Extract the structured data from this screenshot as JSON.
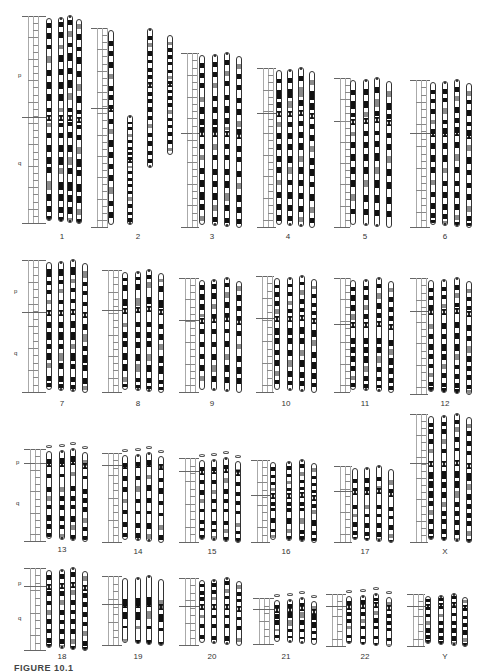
{
  "figure": {
    "caption": "FIGURE 10.1",
    "arm_labels": {
      "p": "p",
      "q": "q"
    },
    "colors": {
      "dark": "#111111",
      "grey": "#8a8a8a",
      "outline": "#333333",
      "background": "#ffffff"
    }
  },
  "chromosomes": [
    {
      "id": "1",
      "label": "1",
      "x": 28,
      "top": 18,
      "height": 203,
      "cen": 0.49,
      "cols": [
        46,
        58,
        67,
        76
      ],
      "labelX": 62,
      "labelY": 232,
      "armP": [
        18,
        72
      ],
      "armQ": [
        18,
        160
      ],
      "bands": [
        [
          0.02,
          0.025
        ],
        [
          0.07,
          0.03
        ],
        [
          0.13,
          0.02
        ],
        [
          0.18,
          0.035
        ],
        [
          0.25,
          0.03
        ],
        [
          0.31,
          0.035
        ],
        [
          0.37,
          0.035
        ],
        [
          0.44,
          0.02
        ],
        [
          0.51,
          0.02
        ],
        [
          0.56,
          0.025
        ],
        [
          0.62,
          0.035
        ],
        [
          0.68,
          0.035
        ],
        [
          0.73,
          0.03
        ],
        [
          0.8,
          0.04
        ],
        [
          0.86,
          0.035
        ],
        [
          0.92,
          0.03
        ],
        [
          0.97,
          0.02
        ]
      ]
    },
    {
      "id": "2",
      "label": "2",
      "x": 97,
      "top": 30,
      "height": 195,
      "cen": 0.4,
      "cols": [
        108,
        127,
        147,
        167
      ],
      "labelX": 138,
      "labelY": 232,
      "split": true,
      "bands": [
        [
          0.05,
          0.025
        ],
        [
          0.1,
          0.03
        ],
        [
          0.16,
          0.03
        ],
        [
          0.22,
          0.025
        ],
        [
          0.28,
          0.03
        ],
        [
          0.33,
          0.025
        ],
        [
          0.38,
          0.02
        ],
        [
          0.45,
          0.025
        ],
        [
          0.5,
          0.03
        ],
        [
          0.56,
          0.035
        ],
        [
          0.62,
          0.03
        ],
        [
          0.68,
          0.03
        ],
        [
          0.74,
          0.03
        ],
        [
          0.8,
          0.035
        ],
        [
          0.87,
          0.03
        ],
        [
          0.93,
          0.03
        ]
      ]
    },
    {
      "id": "3",
      "label": "3",
      "x": 187,
      "top": 55,
      "height": 170,
      "cen": 0.46,
      "cols": [
        199,
        212,
        224,
        236
      ],
      "labelX": 212,
      "labelY": 232,
      "bands": [
        [
          0.04,
          0.03
        ],
        [
          0.1,
          0.03
        ],
        [
          0.16,
          0.03
        ],
        [
          0.24,
          0.03
        ],
        [
          0.3,
          0.04
        ],
        [
          0.37,
          0.035
        ],
        [
          0.42,
          0.02
        ],
        [
          0.52,
          0.03
        ],
        [
          0.58,
          0.03
        ],
        [
          0.66,
          0.035
        ],
        [
          0.73,
          0.04
        ],
        [
          0.8,
          0.045
        ],
        [
          0.87,
          0.035
        ],
        [
          0.94,
          0.03
        ]
      ]
    },
    {
      "id": "4",
      "label": "4",
      "x": 263,
      "top": 70,
      "height": 155,
      "cen": 0.28,
      "cols": [
        276,
        287,
        298,
        309
      ],
      "labelX": 288,
      "labelY": 232,
      "bands": [
        [
          0.05,
          0.03
        ],
        [
          0.12,
          0.06
        ],
        [
          0.2,
          0.04
        ],
        [
          0.33,
          0.03
        ],
        [
          0.4,
          0.04
        ],
        [
          0.47,
          0.04
        ],
        [
          0.55,
          0.04
        ],
        [
          0.62,
          0.04
        ],
        [
          0.7,
          0.035
        ],
        [
          0.78,
          0.04
        ],
        [
          0.86,
          0.04
        ],
        [
          0.93,
          0.035
        ]
      ]
    },
    {
      "id": "5",
      "label": "5",
      "x": 340,
      "top": 80,
      "height": 145,
      "cen": 0.28,
      "cols": [
        350,
        363,
        374,
        386
      ],
      "labelX": 365,
      "labelY": 232,
      "bands": [
        [
          0.06,
          0.04
        ],
        [
          0.14,
          0.05
        ],
        [
          0.22,
          0.03
        ],
        [
          0.35,
          0.03
        ],
        [
          0.42,
          0.04
        ],
        [
          0.5,
          0.05
        ],
        [
          0.59,
          0.05
        ],
        [
          0.68,
          0.05
        ],
        [
          0.78,
          0.05
        ],
        [
          0.88,
          0.04
        ]
      ]
    },
    {
      "id": "6",
      "label": "6",
      "x": 416,
      "top": 82,
      "height": 143,
      "cen": 0.36,
      "cols": [
        430,
        442,
        454,
        466
      ],
      "labelX": 445,
      "labelY": 232,
      "bands": [
        [
          0.05,
          0.03
        ],
        [
          0.11,
          0.03
        ],
        [
          0.18,
          0.04
        ],
        [
          0.26,
          0.03
        ],
        [
          0.32,
          0.04
        ],
        [
          0.42,
          0.04
        ],
        [
          0.5,
          0.05
        ],
        [
          0.59,
          0.04
        ],
        [
          0.68,
          0.035
        ],
        [
          0.76,
          0.04
        ],
        [
          0.84,
          0.04
        ],
        [
          0.91,
          0.035
        ],
        [
          0.96,
          0.02
        ]
      ]
    },
    {
      "id": "7",
      "label": "7",
      "x": 28,
      "top": 262,
      "height": 128,
      "cen": 0.39,
      "cols": [
        46,
        58,
        70,
        82
      ],
      "labelX": 62,
      "labelY": 399,
      "armP": [
        14,
        288
      ],
      "armQ": [
        14,
        350
      ],
      "bands": [
        [
          0.05,
          0.06
        ],
        [
          0.14,
          0.03
        ],
        [
          0.21,
          0.03
        ],
        [
          0.29,
          0.03
        ],
        [
          0.46,
          0.05
        ],
        [
          0.54,
          0.06
        ],
        [
          0.63,
          0.04
        ],
        [
          0.7,
          0.06
        ],
        [
          0.78,
          0.04
        ],
        [
          0.88,
          0.04
        ],
        [
          0.94,
          0.03
        ]
      ]
    },
    {
      "id": "8",
      "label": "8",
      "x": 108,
      "top": 272,
      "height": 118,
      "cen": 0.32,
      "cols": [
        122,
        135,
        146,
        158
      ],
      "labelX": 138,
      "labelY": 399,
      "bands": [
        [
          0.04,
          0.03
        ],
        [
          0.1,
          0.05
        ],
        [
          0.22,
          0.06
        ],
        [
          0.42,
          0.04
        ],
        [
          0.5,
          0.05
        ],
        [
          0.58,
          0.05
        ],
        [
          0.68,
          0.06
        ],
        [
          0.77,
          0.06
        ],
        [
          0.88,
          0.04
        ],
        [
          0.94,
          0.03
        ]
      ]
    },
    {
      "id": "9",
      "label": "9",
      "x": 185,
      "top": 280,
      "height": 110,
      "cen": 0.36,
      "cols": [
        199,
        211,
        224,
        236
      ],
      "labelX": 212,
      "labelY": 399,
      "bands": [
        [
          0.04,
          0.04
        ],
        [
          0.12,
          0.05
        ],
        [
          0.21,
          0.05
        ],
        [
          0.3,
          0.03
        ],
        [
          0.44,
          0.04
        ],
        [
          0.55,
          0.05
        ],
        [
          0.66,
          0.05
        ],
        [
          0.76,
          0.06
        ],
        [
          0.86,
          0.05
        ]
      ]
    },
    {
      "id": "10",
      "label": "10",
      "x": 262,
      "top": 278,
      "height": 112,
      "cen": 0.36,
      "cols": [
        274,
        287,
        299,
        311
      ],
      "labelX": 286,
      "labelY": 399,
      "bands": [
        [
          0.05,
          0.03
        ],
        [
          0.12,
          0.04
        ],
        [
          0.2,
          0.04
        ],
        [
          0.27,
          0.04
        ],
        [
          0.44,
          0.06
        ],
        [
          0.53,
          0.05
        ],
        [
          0.63,
          0.05
        ],
        [
          0.72,
          0.06
        ],
        [
          0.82,
          0.05
        ],
        [
          0.9,
          0.04
        ]
      ]
    },
    {
      "id": "11",
      "label": "11",
      "x": 340,
      "top": 280,
      "height": 110,
      "cen": 0.4,
      "cols": [
        350,
        363,
        376,
        388
      ],
      "labelX": 365,
      "labelY": 399,
      "bands": [
        [
          0.05,
          0.04
        ],
        [
          0.13,
          0.05
        ],
        [
          0.22,
          0.05
        ],
        [
          0.3,
          0.05
        ],
        [
          0.52,
          0.05
        ],
        [
          0.6,
          0.05
        ],
        [
          0.68,
          0.06
        ],
        [
          0.77,
          0.05
        ],
        [
          0.86,
          0.04
        ],
        [
          0.93,
          0.03
        ]
      ]
    },
    {
      "id": "12",
      "label": "12",
      "x": 416,
      "top": 280,
      "height": 112,
      "cen": 0.28,
      "cols": [
        428,
        441,
        454,
        466
      ],
      "labelX": 445,
      "labelY": 399,
      "bands": [
        [
          0.06,
          0.04
        ],
        [
          0.13,
          0.04
        ],
        [
          0.21,
          0.04
        ],
        [
          0.38,
          0.05
        ],
        [
          0.47,
          0.05
        ],
        [
          0.56,
          0.06
        ],
        [
          0.65,
          0.05
        ],
        [
          0.74,
          0.04
        ],
        [
          0.82,
          0.04
        ],
        [
          0.9,
          0.04
        ],
        [
          0.95,
          0.03
        ]
      ]
    },
    {
      "id": "13",
      "label": "13",
      "x": 30,
      "top": 451,
      "height": 88,
      "cen": 0.14,
      "sat": true,
      "cols": [
        46,
        59,
        70,
        82
      ],
      "labelX": 62,
      "labelY": 545,
      "armP": [
        16,
        459
      ],
      "armQ": [
        16,
        500
      ],
      "bands": [
        [
          0.08,
          0.06
        ],
        [
          0.25,
          0.04
        ],
        [
          0.4,
          0.05
        ],
        [
          0.5,
          0.06
        ],
        [
          0.6,
          0.05
        ],
        [
          0.72,
          0.06
        ],
        [
          0.82,
          0.05
        ],
        [
          0.92,
          0.05
        ]
      ]
    },
    {
      "id": "14",
      "label": "14",
      "x": 108,
      "top": 455,
      "height": 85,
      "cen": 0.12,
      "sat": true,
      "cols": [
        122,
        135,
        146,
        158
      ],
      "labelX": 138,
      "labelY": 547,
      "bands": [
        [
          0.08,
          0.05
        ],
        [
          0.24,
          0.05
        ],
        [
          0.36,
          0.06
        ],
        [
          0.5,
          0.05
        ],
        [
          0.64,
          0.04
        ],
        [
          0.78,
          0.06
        ],
        [
          0.9,
          0.05
        ]
      ]
    },
    {
      "id": "15",
      "label": "15",
      "x": 185,
      "top": 460,
      "height": 80,
      "cen": 0.14,
      "sat": true,
      "cols": [
        199,
        211,
        223,
        235
      ],
      "labelX": 212,
      "labelY": 547,
      "bands": [
        [
          0.08,
          0.05
        ],
        [
          0.24,
          0.05
        ],
        [
          0.36,
          0.06
        ],
        [
          0.48,
          0.05
        ],
        [
          0.6,
          0.04
        ],
        [
          0.74,
          0.05
        ],
        [
          0.84,
          0.04
        ],
        [
          0.93,
          0.04
        ]
      ]
    },
    {
      "id": "16",
      "label": "16",
      "x": 257,
      "top": 462,
      "height": 78,
      "cen": 0.42,
      "cols": [
        270,
        286,
        299,
        311
      ],
      "labelX": 286,
      "labelY": 547,
      "bands": [
        [
          0.05,
          0.05
        ],
        [
          0.15,
          0.04
        ],
        [
          0.24,
          0.04
        ],
        [
          0.32,
          0.04
        ],
        [
          0.5,
          0.05
        ],
        [
          0.58,
          0.04
        ],
        [
          0.7,
          0.07
        ],
        [
          0.84,
          0.05
        ],
        [
          0.92,
          0.04
        ]
      ]
    },
    {
      "id": "17",
      "label": "17",
      "x": 340,
      "top": 468,
      "height": 72,
      "cen": 0.32,
      "cols": [
        352,
        364,
        376,
        388
      ],
      "labelX": 365,
      "labelY": 547,
      "bands": [
        [
          0.14,
          0.06
        ],
        [
          0.26,
          0.05
        ],
        [
          0.5,
          0.06
        ],
        [
          0.62,
          0.04
        ],
        [
          0.74,
          0.07
        ],
        [
          0.86,
          0.06
        ],
        [
          0.94,
          0.03
        ]
      ]
    },
    {
      "id": "X",
      "label": "X",
      "x": 416,
      "top": 416,
      "height": 124,
      "cen": 0.38,
      "cols": [
        428,
        441,
        454,
        466
      ],
      "labelX": 445,
      "labelY": 547,
      "bands": [
        [
          0.05,
          0.03
        ],
        [
          0.1,
          0.04
        ],
        [
          0.18,
          0.04
        ],
        [
          0.26,
          0.03
        ],
        [
          0.44,
          0.06
        ],
        [
          0.52,
          0.05
        ],
        [
          0.6,
          0.05
        ],
        [
          0.68,
          0.04
        ],
        [
          0.75,
          0.04
        ],
        [
          0.82,
          0.04
        ],
        [
          0.9,
          0.04
        ],
        [
          0.96,
          0.03
        ]
      ]
    },
    {
      "id": "18",
      "label": "18",
      "x": 30,
      "top": 570,
      "height": 78,
      "cen": 0.2,
      "cols": [
        46,
        59,
        70,
        82
      ],
      "labelX": 62,
      "labelY": 652,
      "armP": [
        18,
        580
      ],
      "armQ": [
        18,
        615
      ],
      "bands": [
        [
          0.05,
          0.06
        ],
        [
          0.26,
          0.06
        ],
        [
          0.38,
          0.06
        ],
        [
          0.5,
          0.06
        ],
        [
          0.62,
          0.06
        ],
        [
          0.74,
          0.06
        ],
        [
          0.86,
          0.06
        ],
        [
          0.94,
          0.04
        ]
      ]
    },
    {
      "id": "19",
      "label": "19",
      "x": 108,
      "top": 578,
      "height": 65,
      "cen": 0.4,
      "cols": [
        122,
        135,
        146,
        158
      ],
      "labelX": 138,
      "labelY": 652,
      "bands": [
        [
          0.3,
          0.12
        ],
        [
          0.5,
          0.12
        ],
        [
          0.72,
          0.04
        ],
        [
          0.92,
          0.05
        ]
      ]
    },
    {
      "id": "20",
      "label": "20",
      "x": 185,
      "top": 580,
      "height": 63,
      "cen": 0.42,
      "cols": [
        199,
        211,
        224,
        236
      ],
      "labelX": 212,
      "labelY": 652,
      "bands": [
        [
          0.05,
          0.05
        ],
        [
          0.16,
          0.06
        ],
        [
          0.26,
          0.05
        ],
        [
          0.54,
          0.05
        ],
        [
          0.68,
          0.06
        ],
        [
          0.86,
          0.06
        ]
      ]
    },
    {
      "id": "21",
      "label": "21",
      "x": 259,
      "top": 600,
      "height": 42,
      "cen": 0.22,
      "sat": true,
      "cols": [
        274,
        287,
        299,
        311
      ],
      "labelX": 286,
      "labelY": 652,
      "bands": [
        [
          0.1,
          0.06
        ],
        [
          0.3,
          0.12
        ],
        [
          0.46,
          0.12
        ],
        [
          0.66,
          0.06
        ],
        [
          0.82,
          0.05
        ]
      ]
    },
    {
      "id": "22",
      "label": "22",
      "x": 332,
      "top": 596,
      "height": 48,
      "cen": 0.2,
      "sat": true,
      "cols": [
        346,
        360,
        373,
        386
      ],
      "labelX": 365,
      "labelY": 652,
      "bands": [
        [
          0.08,
          0.06
        ],
        [
          0.32,
          0.07
        ],
        [
          0.46,
          0.08
        ],
        [
          0.6,
          0.06
        ],
        [
          0.8,
          0.05
        ],
        [
          0.92,
          0.06
        ]
      ]
    },
    {
      "id": "Y",
      "label": "Y",
      "x": 413,
      "top": 596,
      "height": 48,
      "cen": 0.2,
      "cols": [
        425,
        438,
        451,
        462
      ],
      "labelX": 445,
      "labelY": 652,
      "bands": [
        [
          0.04,
          0.06
        ],
        [
          0.2,
          0.04
        ],
        [
          0.36,
          0.06
        ],
        [
          0.5,
          0.08
        ],
        [
          0.64,
          0.1
        ],
        [
          0.8,
          0.08
        ],
        [
          0.9,
          0.06
        ]
      ]
    }
  ]
}
